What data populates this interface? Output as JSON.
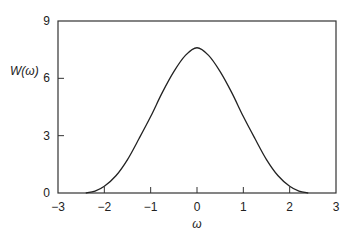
{
  "chart_data": {
    "type": "line",
    "title": "",
    "xlabel": "ω",
    "ylabel": "W(ω)",
    "xlim": [
      -3,
      3
    ],
    "ylim": [
      0,
      9
    ],
    "xticks": [
      -3,
      -2,
      -1,
      0,
      1,
      2,
      3
    ],
    "xtick_labels": [
      "−3",
      "−2",
      "−1",
      "0",
      "1",
      "2",
      "3"
    ],
    "yticks": [
      0,
      3,
      6,
      9
    ],
    "ytick_labels": [
      "0",
      "3",
      "6",
      "9"
    ],
    "grid": false,
    "legend": null,
    "series": [
      {
        "name": "W(ω)",
        "x": [
          -2.4,
          -2.2,
          -2.0,
          -1.75,
          -1.5,
          -1.25,
          -1.0,
          -0.75,
          -0.5,
          -0.25,
          0.0,
          0.25,
          0.5,
          0.75,
          1.0,
          1.25,
          1.5,
          1.75,
          2.0,
          2.2,
          2.4
        ],
        "y": [
          0.0,
          0.1,
          0.35,
          0.9,
          1.75,
          2.85,
          4.0,
          5.25,
          6.35,
          7.2,
          7.6,
          7.2,
          6.35,
          5.25,
          4.0,
          2.85,
          1.75,
          0.9,
          0.35,
          0.1,
          0.0
        ]
      }
    ]
  },
  "labels": {
    "ylabel": "W(ω)",
    "xlabel": "ω"
  }
}
